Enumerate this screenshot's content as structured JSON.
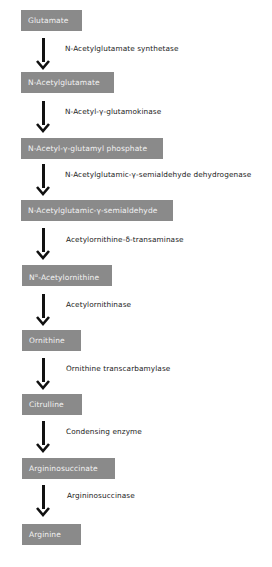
{
  "diagram": {
    "box_color": "#8a8a8a",
    "box_text_color": "#f2f2f2",
    "arrow_color": "#111111",
    "metabolites": [
      {
        "label": "Glutamate"
      },
      {
        "label": "N-Acetylglutamate"
      },
      {
        "label": "N-Acetyl-γ-glutamyl phosphate"
      },
      {
        "label": "N-Acetylglutamic-γ-semialdehyde"
      },
      {
        "label_prefix": "N",
        "label_sup": "α",
        "label_rest": "-Acetylornithine"
      },
      {
        "label": "Ornithine"
      },
      {
        "label": "Citrulline"
      },
      {
        "label": "Argininosuccinate"
      },
      {
        "label": "Arginine"
      }
    ],
    "enzymes": [
      {
        "label": "N-Acetylglutamate synthetase"
      },
      {
        "label": "N-Acetyl-γ-glutamokinase"
      },
      {
        "label": "N-Acetylglutamic-γ-semialdehyde dehydrogenase"
      },
      {
        "label": "Acetylornithine-δ-transaminase"
      },
      {
        "label": "Acetylornithinase"
      },
      {
        "label": "Ornithine transcarbamylase"
      },
      {
        "label": "Condensing enzyme"
      },
      {
        "label": "Argininosuccinase"
      }
    ]
  }
}
